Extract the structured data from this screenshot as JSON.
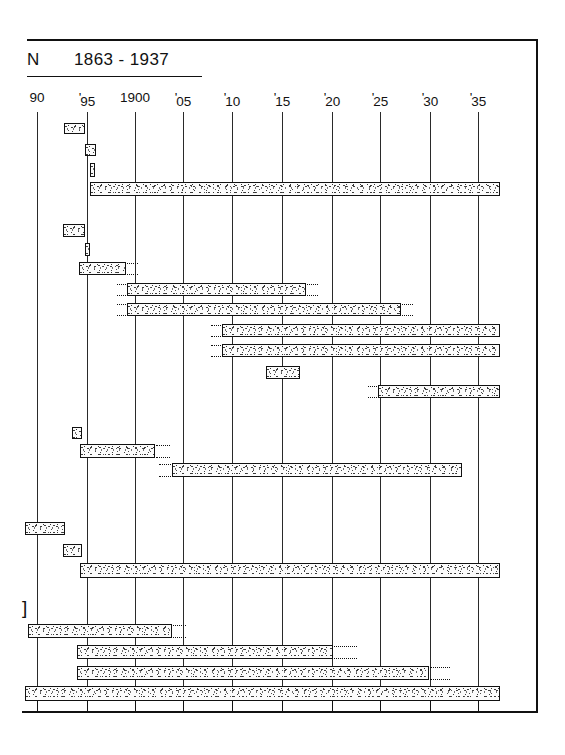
{
  "title": {
    "letter": "N",
    "range": "1863 - 1937",
    "full": "N    1863 - 1937"
  },
  "axis": {
    "tick_labels": [
      "90",
      "'95",
      "1900",
      "'05",
      "'10",
      "'15",
      "'20",
      "'25",
      "'30",
      "'35"
    ],
    "tick_years": [
      1890,
      1895,
      1900,
      1905,
      1910,
      1915,
      1920,
      1925,
      1930,
      1935
    ],
    "tick_x": [
      37,
      87,
      135,
      183,
      232,
      282,
      332,
      380,
      430,
      478
    ],
    "year_origin": 1890,
    "px_per_year": 9.8
  },
  "colors": {
    "ink": "#111111",
    "grid": "#2a2a2a",
    "bar_fill": "#fbfbfb",
    "background": "#ffffff"
  },
  "chart_data": {
    "type": "bar",
    "orientation": "horizontal",
    "title": "N    1863 - 1937",
    "xlabel": "",
    "ylabel": "",
    "xlim": [
      1887,
      1938
    ],
    "grid": true,
    "legend": null,
    "categories": [
      "row-1",
      "row-2",
      "row-3",
      "row-4",
      "row-5",
      "row-6",
      "row-7",
      "row-8",
      "row-9",
      "row-10",
      "row-11",
      "row-12",
      "row-13",
      "row-14",
      "row-15",
      "row-16",
      "row-17",
      "row-18",
      "row-19",
      "row-20",
      "row-21",
      "row-22",
      "row-23"
    ],
    "bars": [
      {
        "id": "row-1",
        "x": 64,
        "y": 123,
        "w": 21,
        "h": 11,
        "start_year": 1892.8,
        "end_year": 1894.9,
        "dots_left": 0,
        "dots_right": 0
      },
      {
        "id": "row-2",
        "x": 85,
        "y": 144,
        "w": 11,
        "h": 12,
        "start_year": 1894.9,
        "end_year": 1896.0,
        "dots_left": 0,
        "dots_right": 0
      },
      {
        "id": "row-3",
        "x": 90,
        "y": 163,
        "w": 5,
        "h": 14,
        "start_year": 1895.4,
        "end_year": 1895.9,
        "dots_left": 0,
        "dots_right": 0
      },
      {
        "id": "row-4",
        "x": 90,
        "y": 182,
        "w": 410,
        "h": 14,
        "start_year": 1895.4,
        "end_year": 1937.2,
        "dots_left": 0,
        "dots_right": 0
      },
      {
        "id": "row-5",
        "x": 63,
        "y": 224,
        "w": 22,
        "h": 13,
        "start_year": 1892.7,
        "end_year": 1894.9,
        "dots_left": 0,
        "dots_right": 0
      },
      {
        "id": "row-6",
        "x": 85,
        "y": 243,
        "w": 5,
        "h": 13,
        "start_year": 1894.9,
        "end_year": 1895.4,
        "dots_left": 0,
        "dots_right": 0
      },
      {
        "id": "row-7",
        "x": 79,
        "y": 262,
        "w": 47,
        "h": 13,
        "start_year": 1894.3,
        "end_year": 1899.1,
        "dots_left": 0,
        "dots_right": 11
      },
      {
        "id": "row-8",
        "x": 127,
        "y": 283,
        "w": 179,
        "h": 13,
        "start_year": 1899.2,
        "end_year": 1917.4,
        "dots_left": 9,
        "dots_right": 11
      },
      {
        "id": "row-9",
        "x": 127,
        "y": 303,
        "w": 274,
        "h": 13,
        "start_year": 1899.2,
        "end_year": 1927.0,
        "dots_left": 9,
        "dots_right": 11
      },
      {
        "id": "row-10",
        "x": 222,
        "y": 324,
        "w": 278,
        "h": 13,
        "start_year": 1908.9,
        "end_year": 1937.2,
        "dots_left": 10,
        "dots_right": 0
      },
      {
        "id": "row-11",
        "x": 222,
        "y": 344,
        "w": 278,
        "h": 13,
        "start_year": 1908.9,
        "end_year": 1937.2,
        "dots_left": 10,
        "dots_right": 0
      },
      {
        "id": "row-12",
        "x": 266,
        "y": 366,
        "w": 34,
        "h": 13,
        "start_year": 1913.4,
        "end_year": 1916.8,
        "dots_left": 0,
        "dots_right": 0
      },
      {
        "id": "row-13",
        "x": 378,
        "y": 385,
        "w": 122,
        "h": 13,
        "start_year": 1924.8,
        "end_year": 1937.2,
        "dots_left": 9,
        "dots_right": 0
      },
      {
        "id": "row-14",
        "x": 72,
        "y": 427,
        "w": 10,
        "h": 12,
        "start_year": 1893.6,
        "end_year": 1894.6,
        "dots_left": 0,
        "dots_right": 0
      },
      {
        "id": "row-15",
        "x": 80,
        "y": 444,
        "w": 75,
        "h": 14,
        "start_year": 1894.4,
        "end_year": 1902.0,
        "dots_left": 0,
        "dots_right": 14
      },
      {
        "id": "row-16",
        "x": 172,
        "y": 463,
        "w": 290,
        "h": 14,
        "start_year": 1903.8,
        "end_year": 1933.4,
        "dots_left": 12,
        "dots_right": 0
      },
      {
        "id": "row-17",
        "x": 25,
        "y": 522,
        "w": 40,
        "h": 13,
        "start_year": 1888.8,
        "end_year": 1892.9,
        "dots_left": 0,
        "dots_right": 0
      },
      {
        "id": "row-18",
        "x": 63,
        "y": 544,
        "w": 19,
        "h": 13,
        "start_year": 1892.7,
        "end_year": 1894.6,
        "dots_left": 0,
        "dots_right": 0
      },
      {
        "id": "row-19",
        "x": 80,
        "y": 563,
        "w": 420,
        "h": 15,
        "start_year": 1894.4,
        "end_year": 1937.2,
        "dots_left": 0,
        "dots_right": 0
      },
      {
        "id": "row-20",
        "x": 28,
        "y": 624,
        "w": 144,
        "h": 14,
        "start_year": 1889.1,
        "end_year": 1903.8,
        "dots_left": 0,
        "dots_right": 13
      },
      {
        "id": "row-21",
        "x": 77,
        "y": 645,
        "w": 256,
        "h": 14,
        "start_year": 1894.1,
        "end_year": 1920.2,
        "dots_left": 0,
        "dots_right": 23
      },
      {
        "id": "row-22",
        "x": 77,
        "y": 666,
        "w": 352,
        "h": 14,
        "start_year": 1894.1,
        "end_year": 1929.9,
        "dots_left": 0,
        "dots_right": 20
      },
      {
        "id": "row-23",
        "x": 25,
        "y": 686,
        "w": 475,
        "h": 15,
        "start_year": 1888.8,
        "end_year": 1937.2,
        "dots_left": 0,
        "dots_right": 0
      }
    ],
    "bracket_marker": {
      "glyph": "]",
      "x": 22,
      "y": 598
    }
  }
}
